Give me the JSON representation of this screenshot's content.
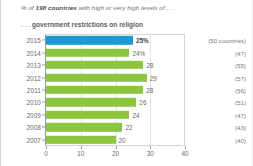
{
  "header": {
    "title_prefix": "% of ",
    "title_emphasis": "198 countries",
    "title_suffix": " with high or very high levels of . . .",
    "subtitle_lead": ". . . ",
    "subtitle_text": "government restrictions on religion"
  },
  "colors": {
    "highlight_bar": "#1b9ad6",
    "bar": "#8cc63f",
    "axis": "#9a9a9a",
    "grid": "#e3e3e3",
    "text": "#6a6a6a"
  },
  "chart_data": {
    "type": "bar",
    "orientation": "horizontal",
    "xlabel": "",
    "ylabel": "",
    "xlim": [
      0,
      40
    ],
    "xticks": [
      0,
      10,
      20,
      30,
      40
    ],
    "xtick_labels": [
      "0",
      "10",
      "20",
      "30",
      "40"
    ],
    "grid": true,
    "legend": false,
    "categories": [
      "2015",
      "2014",
      "2013",
      "2012",
      "2011",
      "2010",
      "2009",
      "2008",
      "2007"
    ],
    "values": [
      25,
      24,
      28,
      29,
      28,
      26,
      24,
      22,
      20
    ],
    "value_labels": [
      "25%",
      "24%",
      "28",
      "29",
      "28",
      "26",
      "24",
      "22",
      "20"
    ],
    "annotations": [
      "(50 countries)",
      "(47)",
      "(55)",
      "(57)",
      "(56)",
      "(51)",
      "(47)",
      "(43)",
      "(40)"
    ],
    "highlight_index": 0
  }
}
